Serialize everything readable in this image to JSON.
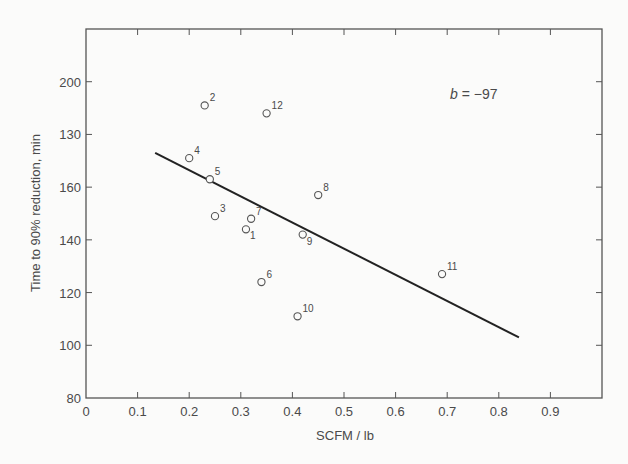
{
  "chart_data": {
    "type": "scatter",
    "title": "",
    "xlabel": "SCFM / lb",
    "ylabel": "Time to 90% reduction, min",
    "xlim": [
      0,
      1.0
    ],
    "ylim": [
      80,
      220
    ],
    "x_ticks": [
      0,
      0.1,
      0.2,
      0.3,
      0.4,
      0.5,
      0.6,
      0.7,
      0.8,
      0.9
    ],
    "x_tick_labels": [
      "0",
      "0.1",
      "0.2",
      "0.3",
      "0.4",
      "0.5",
      "0.6",
      "0.7",
      "0.8",
      "0.9"
    ],
    "y_ticks": [
      80,
      100,
      120,
      140,
      160,
      180,
      200
    ],
    "y_tick_labels": [
      "80",
      "100",
      "120",
      "140",
      "160",
      "130",
      "200"
    ],
    "grid": false,
    "legend": null,
    "annotation": "b = -97",
    "points": [
      {
        "label": "1",
        "x": 0.31,
        "y": 144
      },
      {
        "label": "2",
        "x": 0.23,
        "y": 191
      },
      {
        "label": "3",
        "x": 0.25,
        "y": 149
      },
      {
        "label": "4",
        "x": 0.2,
        "y": 171
      },
      {
        "label": "5",
        "x": 0.24,
        "y": 163
      },
      {
        "label": "6",
        "x": 0.34,
        "y": 124
      },
      {
        "label": "7",
        "x": 0.32,
        "y": 148
      },
      {
        "label": "8",
        "x": 0.45,
        "y": 157
      },
      {
        "label": "9",
        "x": 0.42,
        "y": 142
      },
      {
        "label": "10",
        "x": 0.41,
        "y": 111
      },
      {
        "label": "11",
        "x": 0.69,
        "y": 127
      },
      {
        "label": "12",
        "x": 0.35,
        "y": 188
      }
    ],
    "series": [
      {
        "name": "observations",
        "type": "scatter",
        "marker": "open-circle"
      },
      {
        "name": "regression line",
        "type": "line",
        "x": [
          0.134,
          0.839
        ],
        "y": [
          173,
          103
        ],
        "slope": -97
      }
    ]
  }
}
